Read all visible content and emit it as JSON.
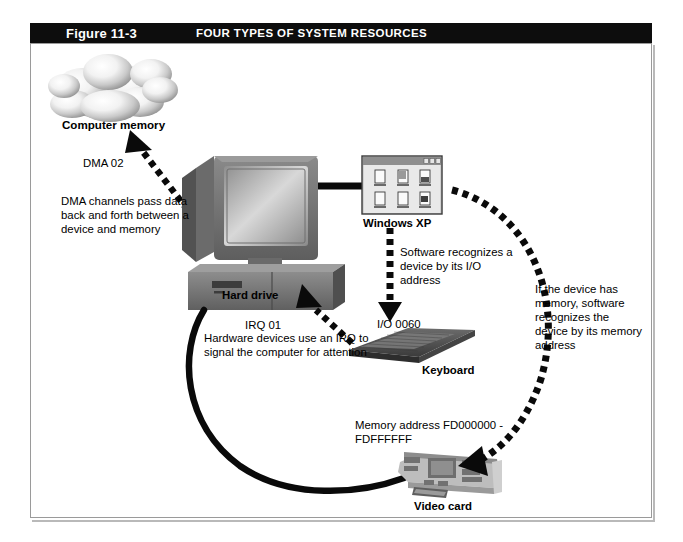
{
  "figure": {
    "number": "Figure 11-3",
    "caption": "FOUR TYPES OF SYSTEM RESOURCES",
    "title_bar_color": "#0d0d0d",
    "title_text_color": "#ffffff",
    "border_color": "#9a9a9a",
    "background_color": "#ffffff"
  },
  "labels": {
    "computer_memory": "Computer memory",
    "dma_channel": "DMA 02",
    "dma_description": "DMA channels pass data back and forth between a device and memory",
    "windows_xp": "Windows XP",
    "software_io_description": "Software recognizes a device by its I/O address",
    "io_address": "I/O 0060",
    "keyboard": "Keyboard",
    "hard_drive": "Hard drive",
    "irq": "IRQ 01",
    "irq_description": "Hardware devices use an IRQ to signal the computer for attention",
    "memory_software_description": "If the device has memory, software recognizes the device by its memory address",
    "memory_address": "Memory address FD000000 - FDFFFFFF",
    "video_card": "Video card"
  },
  "graphics": {
    "cloud": "computer-memory-cloud",
    "computer": "desktop-computer",
    "window": "windows-xp-window",
    "keyboard": "keyboard-device",
    "videocard": "video-card-device",
    "dma_arrow": "dashed-double-arrow",
    "io_arrow": "dashed-down-arrow",
    "irq_arrow": "dashed-up-left-arrow",
    "memory_arc": "dashed-curved-arrow",
    "cable": "solid-black-cable"
  },
  "colors": {
    "ink": "#000000",
    "device_dark": "#4a4a4a",
    "device_mid": "#7d7d7d",
    "device_light": "#b5b5b5",
    "screen": "#9c9c9c",
    "cloud_light": "#ffffff",
    "cloud_shade": "#9e9e9e"
  }
}
